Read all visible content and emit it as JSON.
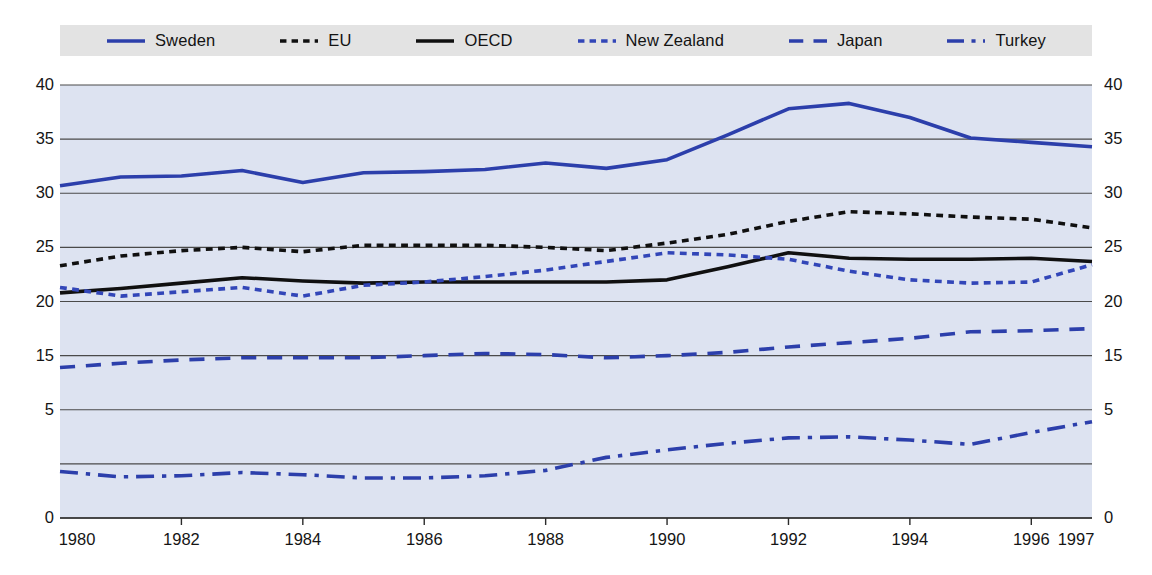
{
  "legend": {
    "position": "top",
    "items": [
      {
        "label": "Sweden",
        "style": "solid",
        "color": "#2c3fab",
        "icon": "line-solid-icon"
      },
      {
        "label": "EU",
        "style": "dotted",
        "color": "#101010",
        "icon": "line-dotted-icon"
      },
      {
        "label": "OECD",
        "style": "solid",
        "color": "#101010",
        "icon": "line-solid-icon"
      },
      {
        "label": "New Zealand",
        "style": "dotted",
        "color": "#3246b8",
        "icon": "line-dotted-icon"
      },
      {
        "label": "Japan",
        "style": "dashed",
        "color": "#2c3fab",
        "icon": "line-dashed-icon"
      },
      {
        "label": "Turkey",
        "style": "dashdot",
        "color": "#2c3fab",
        "icon": "line-dashdot-icon"
      }
    ]
  },
  "colors": {
    "blue": "#2c3fab",
    "black": "#101010",
    "plot_background": "#dde3f1",
    "legend_background": "#e3e3e3",
    "gridline": "#4a4a4a",
    "page_background": "#ffffff"
  },
  "chart_data": {
    "type": "line",
    "title": "",
    "subtitle": "",
    "xlabel": "",
    "ylabel": "",
    "grid": true,
    "legend_position": "top",
    "xlim": [
      1980,
      1997
    ],
    "ylim": [
      0,
      40
    ],
    "x": [
      1980,
      1981,
      1982,
      1983,
      1984,
      1985,
      1986,
      1987,
      1988,
      1989,
      1990,
      1991,
      1992,
      1993,
      1994,
      1995,
      1996,
      1997
    ],
    "xticks": [
      "1980",
      "1982",
      "1984",
      "1986",
      "1988",
      "1990",
      "1992",
      "1994",
      "1996",
      "1997"
    ],
    "xtick_values": [
      1980,
      1982,
      1984,
      1986,
      1988,
      1990,
      1992,
      1994,
      1996,
      1997
    ],
    "yticks": [
      "40",
      "35",
      "30",
      "25",
      "20",
      "15",
      "5",
      "0"
    ],
    "ytick_values": [
      40,
      35,
      30,
      25,
      20,
      15,
      10,
      0
    ],
    "yticks_right": [
      "40",
      "35",
      "30",
      "25",
      "20",
      "15",
      "5",
      "0"
    ],
    "gridline_values": [
      0,
      5,
      10,
      15,
      20,
      25,
      30,
      35,
      40
    ],
    "series": [
      {
        "name": "Sweden",
        "style": "solid",
        "color": "#2c3fab",
        "values": [
          30.7,
          31.5,
          31.6,
          32.1,
          31.0,
          31.9,
          32.0,
          32.2,
          32.8,
          32.3,
          33.1,
          35.4,
          37.8,
          38.3,
          37.0,
          35.1,
          34.7,
          34.3
        ]
      },
      {
        "name": "EU",
        "style": "dotted",
        "color": "#101010",
        "values": [
          23.3,
          24.2,
          24.7,
          25.0,
          24.6,
          25.2,
          25.2,
          25.2,
          25.0,
          24.7,
          25.4,
          26.2,
          27.4,
          28.3,
          28.1,
          27.8,
          27.6,
          26.8
        ]
      },
      {
        "name": "OECD",
        "style": "solid",
        "color": "#101010",
        "values": [
          20.8,
          21.2,
          21.7,
          22.2,
          21.9,
          21.7,
          21.8,
          21.8,
          21.8,
          21.8,
          22.0,
          23.2,
          24.5,
          24.0,
          23.9,
          23.9,
          24.0,
          23.7
        ]
      },
      {
        "name": "New Zealand",
        "style": "dotted",
        "color": "#3246b8",
        "values": [
          21.3,
          20.5,
          20.9,
          21.3,
          20.5,
          21.5,
          21.8,
          22.3,
          22.9,
          23.7,
          24.5,
          24.3,
          23.9,
          22.8,
          22.0,
          21.7,
          21.8,
          23.4
        ]
      },
      {
        "name": "Japan",
        "style": "dashed",
        "color": "#2c3fab",
        "values": [
          13.9,
          14.3,
          14.6,
          14.8,
          14.8,
          14.8,
          15.0,
          15.2,
          15.1,
          14.8,
          15.0,
          15.3,
          15.8,
          16.2,
          16.6,
          17.2,
          17.3,
          17.5
        ]
      },
      {
        "name": "Turkey",
        "style": "dashdot",
        "color": "#2c3fab",
        "values": [
          4.3,
          3.8,
          3.9,
          4.2,
          4.0,
          3.7,
          3.7,
          3.9,
          4.4,
          5.6,
          6.3,
          6.9,
          7.4,
          7.5,
          7.2,
          6.8,
          7.9,
          8.9
        ]
      }
    ]
  }
}
